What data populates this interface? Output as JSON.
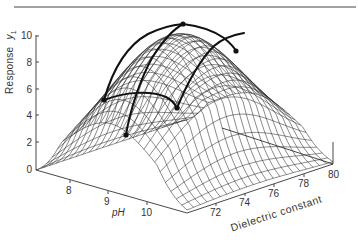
{
  "chart_data": {
    "type": "surface3d",
    "title": "",
    "zlabel": "Response y1",
    "zlabel_main": "Response",
    "zlabel_sym": "y",
    "zlabel_sub": "1",
    "xlabel": "pH",
    "ylabel": "Dielectric constant",
    "z_ticks": [
      "0",
      "2",
      "4",
      "6",
      "8",
      "10"
    ],
    "z_range": [
      0,
      10
    ],
    "x_ticks": [
      "8",
      "9",
      "10"
    ],
    "y_ticks": [
      "72",
      "74",
      "76",
      "78",
      "80"
    ],
    "surface": "dome-shaped response surface with maximum ≈ 10 near pH ≈ 9.3, dielectric constant ≈ 76",
    "highlighted_points": [
      {
        "label": "A",
        "approx_response": 5.2
      },
      {
        "label": "B",
        "approx_response": 4.6
      },
      {
        "label": "C",
        "approx_response": 2.6
      },
      {
        "label": "D",
        "approx_response": 9.9
      },
      {
        "label": "E",
        "approx_response": 8.3
      }
    ],
    "grid": true,
    "legend": null
  },
  "colors": {
    "line": "#1a1a1a",
    "mesh": "#2b2b2b",
    "background": "#ffffff"
  }
}
